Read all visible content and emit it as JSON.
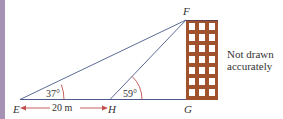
{
  "diagram": {
    "points": {
      "E": "E",
      "F": "F",
      "G": "G",
      "H": "H"
    },
    "angles": {
      "at_E": "37°",
      "at_H": "59°"
    },
    "distance_EH": "20 m",
    "note": {
      "line1": "Not drawn",
      "line2": "accurately"
    },
    "building": {
      "columns": 3,
      "rows": 7
    },
    "colors": {
      "line": "#4a5a8a",
      "arrow": "#c0504d",
      "building": "#a0522d",
      "window": "#ffffff",
      "sidebar": "#a592b5"
    }
  }
}
